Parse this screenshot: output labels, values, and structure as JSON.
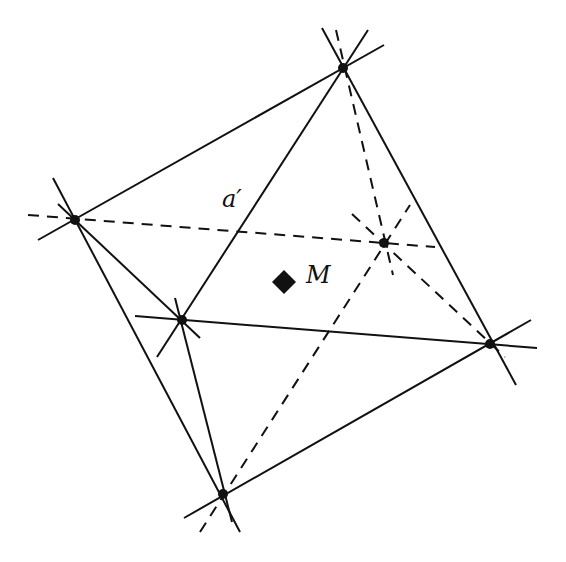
{
  "diagram": {
    "points": {
      "top": {
        "x": 343,
        "y": 68
      },
      "left": {
        "x": 75,
        "y": 220
      },
      "inner": {
        "x": 182,
        "y": 320
      },
      "right": {
        "x": 490,
        "y": 344
      },
      "bottom": {
        "x": 223,
        "y": 494
      },
      "center": {
        "x": 384,
        "y": 243
      }
    },
    "solid_lines": [
      {
        "x1": 38,
        "y1": 240,
        "x2": 384,
        "y2": 45
      },
      {
        "x1": 322,
        "y1": 28,
        "x2": 516,
        "y2": 385
      },
      {
        "x1": 157,
        "y1": 357,
        "x2": 368,
        "y2": 30
      },
      {
        "x1": 53,
        "y1": 178,
        "x2": 240,
        "y2": 532
      },
      {
        "x1": 58,
        "y1": 204,
        "x2": 200,
        "y2": 338
      },
      {
        "x1": 175,
        "y1": 298,
        "x2": 232,
        "y2": 522
      },
      {
        "x1": 184,
        "y1": 518,
        "x2": 531,
        "y2": 320
      },
      {
        "x1": 135,
        "y1": 316,
        "x2": 537,
        "y2": 348
      }
    ],
    "dashed_lines": [
      {
        "x1": 28,
        "y1": 215,
        "x2": 435,
        "y2": 247
      },
      {
        "x1": 336,
        "y1": 30,
        "x2": 393,
        "y2": 275
      },
      {
        "x1": 352,
        "y1": 214,
        "x2": 505,
        "y2": 357
      },
      {
        "x1": 200,
        "y1": 532,
        "x2": 410,
        "y2": 205
      }
    ],
    "labels": {
      "a_prime": {
        "text": "a′",
        "x": 222,
        "y": 207
      },
      "M": {
        "text": "M",
        "x": 306,
        "y": 283
      }
    },
    "marker": {
      "x": 284,
      "y": 282,
      "size": 12
    },
    "colors": {
      "stroke": "#111111",
      "background": "#ffffff"
    }
  }
}
